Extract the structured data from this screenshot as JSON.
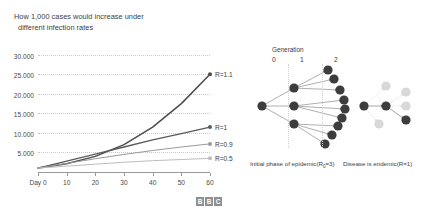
{
  "chart_data": {
    "type": "line",
    "title": "How 1,000 cases would increase under different infection rates",
    "title_line1": "How 1,000 cases would increase under",
    "title_line2": "different infection rates",
    "xlabel": "",
    "ylabel": "",
    "x": [
      0,
      10,
      20,
      30,
      40,
      50,
      60
    ],
    "xlim": [
      0,
      60
    ],
    "ylim": [
      0,
      32000
    ],
    "grid": true,
    "legend_position": "right-inline",
    "y_ticks": [
      {
        "value": 30000,
        "label": "30.000"
      },
      {
        "value": 25000,
        "label": "25.000"
      },
      {
        "value": 20000,
        "label": "20.000"
      },
      {
        "value": 15000,
        "label": "15.000"
      },
      {
        "value": 10000,
        "label": "10.000"
      },
      {
        "value": 5000,
        "label": "5.000"
      }
    ],
    "x_ticks": [
      {
        "value": 0,
        "label": "Day 0"
      },
      {
        "value": 10,
        "label": "10"
      },
      {
        "value": 20,
        "label": "20"
      },
      {
        "value": 30,
        "label": "30"
      },
      {
        "value": 40,
        "label": "40"
      },
      {
        "value": 50,
        "label": "50"
      },
      {
        "value": 60,
        "label": "60"
      }
    ],
    "series": [
      {
        "name": "R=1.1",
        "label": "R=1.1",
        "color": "#4d4d4d",
        "width": 1.5,
        "values": [
          1000,
          2100,
          4000,
          7000,
          11500,
          17500,
          25000
        ]
      },
      {
        "name": "R=1",
        "label": "R=1",
        "color": "#5a5a5a",
        "width": 1.3,
        "values": [
          1000,
          2800,
          4600,
          6400,
          8200,
          9800,
          11500
        ]
      },
      {
        "name": "R=0.9",
        "label": "R=0.9",
        "color": "#9a9a9a",
        "width": 1.0,
        "values": [
          1000,
          2200,
          3400,
          4500,
          5500,
          6400,
          7200
        ]
      },
      {
        "name": "R=0.5",
        "label": "R=0.5",
        "color": "#bdbdbd",
        "width": 1.0,
        "values": [
          1000,
          1500,
          2000,
          2500,
          2900,
          3200,
          3500
        ]
      }
    ]
  },
  "branding": {
    "logo_letters": [
      "B",
      "B",
      "C"
    ]
  },
  "diagram": {
    "generation_label": "Generation",
    "generation_numbers": [
      "0",
      "1",
      "2"
    ],
    "left_caption_prefix": "Initial phase of epidemic(R",
    "left_caption_sub": "0",
    "left_caption_suffix": "=3)",
    "right_caption": "Disease is endemic(R=1)",
    "node_color_active": "#3d3d3d",
    "node_color_faded": "#d8d8d8"
  }
}
